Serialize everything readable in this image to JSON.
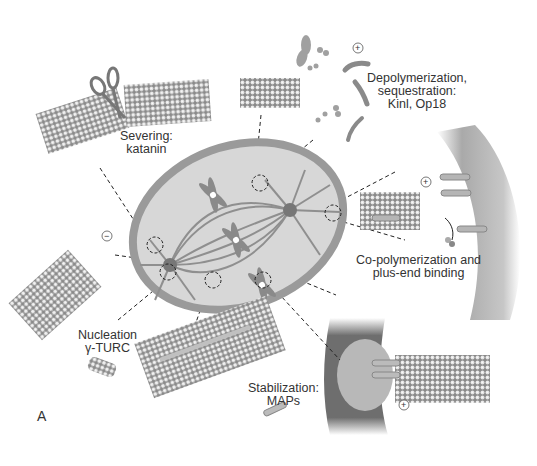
{
  "figure": {
    "panel_letter": "A",
    "colors": {
      "background": "#ffffff",
      "cell_fill": "#d9d9d9",
      "cell_border": "#9a9a9a",
      "microtubule": "#8f8f8f",
      "microtubule_light": "#e8e8e8",
      "membrane": "#7a7a7a",
      "text": "#333333",
      "dashed_line": "#222222"
    }
  },
  "labels": {
    "severing": {
      "line1": "Severing:",
      "line2": "katanin"
    },
    "depolymerization": {
      "line1": "Depolymerization,",
      "line2": "sequestration:",
      "line3": "Kinl, Op18"
    },
    "copolymerization": {
      "line1": "Co-polymerization and",
      "line2": "plus-end binding"
    },
    "nucleation": {
      "line1": "Nucleation",
      "line2": "γ-TURC"
    },
    "stabilization": {
      "line1": "Stabilization:",
      "line2": "MAPs"
    }
  },
  "symbols": {
    "plus": "+",
    "minus": "−"
  }
}
